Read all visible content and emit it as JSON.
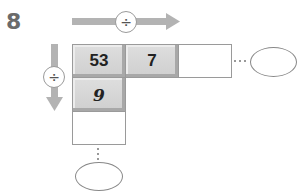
{
  "problem_number": "8",
  "operators": {
    "horizontal": {
      "symbol": "÷",
      "icon": "divide-icon",
      "direction": "right"
    },
    "vertical": {
      "symbol": "÷",
      "icon": "divide-icon",
      "direction": "down"
    }
  },
  "grid": {
    "row1": [
      "53",
      "7",
      ""
    ],
    "column1": [
      "53",
      "9",
      ""
    ]
  },
  "cells": {
    "r1c1": "53",
    "r1c2": "7",
    "r1c3": "",
    "r2c1": "9",
    "r3c1": ""
  },
  "continuation": {
    "horizontal": "···",
    "vertical": "⋮"
  },
  "answers": {
    "right_ellipse": "",
    "bottom_ellipse": ""
  },
  "colors": {
    "arrow": "#b3b3b3",
    "cell_fill": "#d6d6d6",
    "border": "#9a9a9a",
    "number_label": "#6b6b6b"
  }
}
